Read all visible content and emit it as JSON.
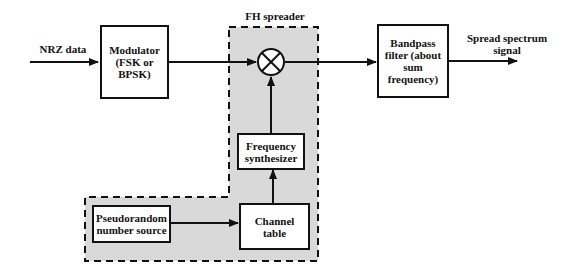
{
  "diagram": {
    "title": "FH spreader",
    "colors": {
      "region_fill": "#d9d9d9",
      "stroke": "#111111",
      "background": "#ffffff"
    },
    "inputs": {
      "nrz_label": "NRZ data"
    },
    "outputs": {
      "spread_label": "Spread spectrum\nsignal"
    },
    "blocks": {
      "modulator": "Modulator\n(FSK or\nBPSK)",
      "mixer_symbol": "⊗",
      "bandpass": "Bandpass\nfilter (about\nsum\nfrequency)",
      "freq_synth": "Frequency\nsynthesizer",
      "channel_table": "Channel\ntable",
      "pn_source": "Pseudorandom\nnumber source"
    },
    "edges": [
      {
        "from": "NRZ data",
        "to": "Modulator"
      },
      {
        "from": "Modulator",
        "to": "Mixer"
      },
      {
        "from": "Mixer",
        "to": "Bandpass filter"
      },
      {
        "from": "Bandpass filter",
        "to": "Spread spectrum signal"
      },
      {
        "from": "Pseudorandom number source",
        "to": "Channel table"
      },
      {
        "from": "Channel table",
        "to": "Frequency synthesizer"
      },
      {
        "from": "Frequency synthesizer",
        "to": "Mixer"
      }
    ]
  }
}
